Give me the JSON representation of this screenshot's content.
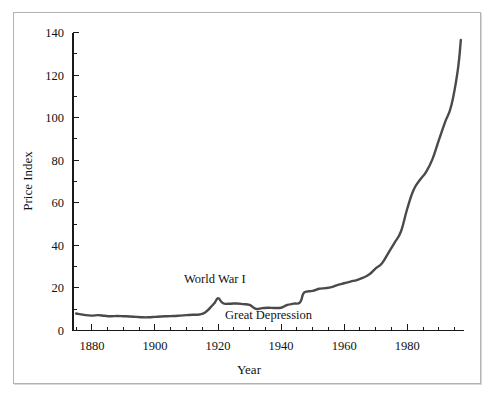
{
  "chart_data": {
    "type": "line",
    "title": "",
    "xlabel": "Year",
    "ylabel": "Price Index",
    "xlim": [
      1874,
      1998
    ],
    "ylim": [
      0,
      140
    ],
    "grid": false,
    "legend": null,
    "x_major_ticks": [
      1880,
      1900,
      1920,
      1940,
      1960,
      1980
    ],
    "x_major_tick_labels": [
      "1880",
      "1900",
      "1920",
      "1940",
      "1960",
      "1980"
    ],
    "x_minor_tick_step": 5,
    "y_major_ticks": [
      0,
      20,
      40,
      60,
      80,
      100,
      120,
      140
    ],
    "y_major_tick_labels": [
      "0",
      "20",
      "40",
      "60",
      "80",
      "100",
      "120",
      "140"
    ],
    "y_minor_tick_step": 10,
    "line_color": "#4a4a4a",
    "annotations": [
      {
        "text": "World War I",
        "x": 1919,
        "y": 22.5
      },
      {
        "text": "Great Depression",
        "x": 1936,
        "y": 5.2
      }
    ],
    "series": [
      {
        "name": "Price Index",
        "x": [
          1875,
          1878,
          1880,
          1882,
          1884,
          1886,
          1888,
          1890,
          1892,
          1894,
          1896,
          1898,
          1900,
          1902,
          1904,
          1906,
          1908,
          1910,
          1912,
          1914,
          1916,
          1918,
          1919,
          1920,
          1921,
          1922,
          1924,
          1926,
          1928,
          1930,
          1932,
          1934,
          1936,
          1938,
          1940,
          1942,
          1944,
          1946,
          1947,
          1948,
          1950,
          1952,
          1954,
          1956,
          1958,
          1960,
          1962,
          1964,
          1966,
          1968,
          1970,
          1972,
          1974,
          1976,
          1978,
          1980,
          1982,
          1984,
          1986,
          1988,
          1990,
          1992,
          1994,
          1996,
          1997
        ],
        "values": [
          8.0,
          7.2,
          7.0,
          7.2,
          6.9,
          6.7,
          6.8,
          6.7,
          6.6,
          6.4,
          6.2,
          6.2,
          6.4,
          6.6,
          6.7,
          6.8,
          7.0,
          7.2,
          7.4,
          7.5,
          8.6,
          11.5,
          13.2,
          15.2,
          13.6,
          12.6,
          12.6,
          12.7,
          12.4,
          12.0,
          10.2,
          10.5,
          10.7,
          10.6,
          10.7,
          12.0,
          12.6,
          13.2,
          17.2,
          18.3,
          18.6,
          19.6,
          19.9,
          20.4,
          21.4,
          22.2,
          23.0,
          23.7,
          24.8,
          26.4,
          29.2,
          31.6,
          36.4,
          41.3,
          46.5,
          57.2,
          66.0,
          70.7,
          74.5,
          80.5,
          89.3,
          97.9,
          105.8,
          122.0,
          136.5
        ]
      }
    ]
  },
  "axis_titles": {
    "x": "Year",
    "y": "Price Index"
  }
}
